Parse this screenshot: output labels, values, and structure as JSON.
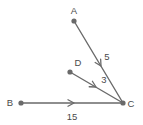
{
  "figure": {
    "background_color": "#ffffff",
    "stroke_color": "#6a6a6a",
    "text_color": "#4a4a4a",
    "points": [
      {
        "name": "A",
        "label": "A",
        "x": 74,
        "y": 21,
        "label_x": 74,
        "label_y": 14
      },
      {
        "name": "B",
        "label": "B",
        "x": 21,
        "y": 103,
        "label_x": 10,
        "label_y": 106
      },
      {
        "name": "C",
        "label": "C",
        "x": 123,
        "y": 103,
        "label_x": 131,
        "label_y": 107
      },
      {
        "name": "D",
        "label": "D",
        "x": 70,
        "y": 72,
        "label_x": 78,
        "label_y": 66
      }
    ],
    "segments": [
      {
        "name": "segment-ca",
        "from": "C",
        "to": "A",
        "x1": 123,
        "y1": 103,
        "x2": 74,
        "y2": 21,
        "length_label": "5",
        "label_x": 107,
        "label_y": 60,
        "arrow_x": 101,
        "arrow_y": 66
      },
      {
        "name": "segment-cd",
        "from": "C",
        "to": "D",
        "x1": 123,
        "y1": 103,
        "x2": 70,
        "y2": 72,
        "length_label": "3",
        "label_x": 104,
        "label_y": 83,
        "arrow_x": 96,
        "arrow_y": 87
      },
      {
        "name": "segment-cb",
        "from": "C",
        "to": "B",
        "x1": 123,
        "y1": 103,
        "x2": 21,
        "y2": 103,
        "length_label": "15",
        "label_x": 72,
        "label_y": 120,
        "arrow_x": 74,
        "arrow_y": 103
      }
    ]
  }
}
